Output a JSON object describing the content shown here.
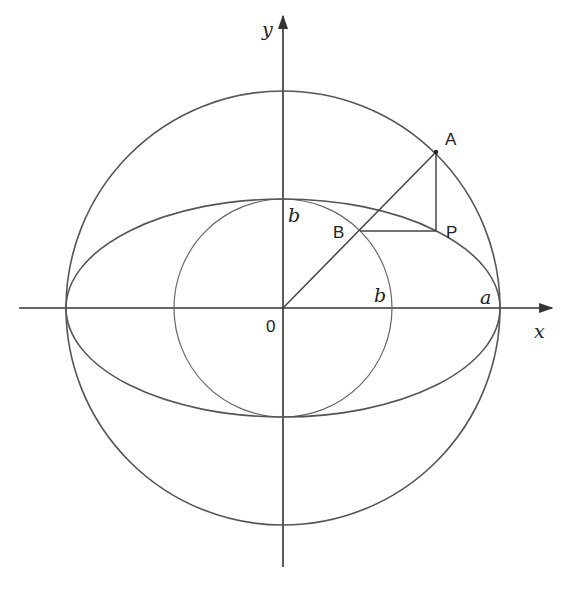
{
  "diagram": {
    "title": "",
    "axes": {
      "x_label": "x",
      "y_label": "y",
      "origin_label": "0"
    },
    "labels": {
      "point_A": "A",
      "point_B": "B",
      "point_P": "P",
      "b_on_y_axis": "b",
      "b_on_x_axis": "b",
      "a_on_x_axis": "a"
    },
    "shapes": [
      {
        "name": "large-circle",
        "type": "circle",
        "radius_label": "a"
      },
      {
        "name": "small-circle",
        "type": "circle",
        "radius_label": "b"
      },
      {
        "name": "ellipse",
        "type": "ellipse",
        "semi_major": "a",
        "semi_minor": "b"
      }
    ],
    "geometry_px": {
      "center": [
        283,
        308
      ],
      "a": 217,
      "b": 109,
      "angle_deg": 45
    },
    "colors": {
      "stroke": "#555555",
      "text": "#222222",
      "background": "#ffffff"
    }
  }
}
